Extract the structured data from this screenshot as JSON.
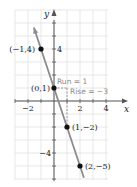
{
  "chart_data": {
    "type": "line",
    "title": "",
    "xlabel": "x",
    "ylabel": "y",
    "xlim": [
      -3,
      4.5
    ],
    "ylim": [
      -6,
      7
    ],
    "grid": true,
    "x_ticks": [
      -2,
      2,
      4
    ],
    "y_ticks": [
      4,
      -4
    ],
    "x_tick_labels": [
      "−2",
      "2",
      "4"
    ],
    "y_tick_labels": [
      "4",
      "−4"
    ],
    "series": [
      {
        "name": "y = -3x + 1",
        "color": "#8c8c8c",
        "line": {
          "slope": -3,
          "intercept": 1,
          "x_start": -1.55,
          "x_end": 2.3
        },
        "points": [
          {
            "x": -1,
            "y": 4,
            "label": "(−1,4)"
          },
          {
            "x": 0,
            "y": 1,
            "label": "(0,1)"
          },
          {
            "x": 1,
            "y": -2,
            "label": "(1,−2)"
          },
          {
            "x": 2,
            "y": -5,
            "label": "(2,−5)"
          }
        ]
      }
    ],
    "annotations": [
      {
        "text": "Run = 1",
        "from": [
          0,
          1
        ],
        "to": [
          1,
          1
        ]
      },
      {
        "text": "Rise = −3",
        "from": [
          1,
          1
        ],
        "to": [
          1,
          -2
        ]
      }
    ]
  },
  "colors": {
    "grid": "#dcdcdc",
    "axis": "#555555",
    "line": "#8c8c8c",
    "point": "#111111",
    "annotation": "#8a8a8a"
  }
}
